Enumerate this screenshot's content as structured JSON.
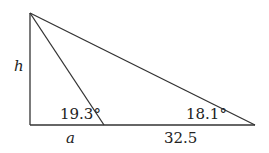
{
  "diagram": {
    "type": "right-triangle-with-cevian",
    "labels": {
      "height": "h",
      "base_left": "a",
      "base_right": "32.5",
      "angle_inner": "19.3°",
      "angle_right": "18.1°"
    },
    "points": {
      "top": [
        30,
        13
      ],
      "bottom_left": [
        30,
        125
      ],
      "foot": [
        104,
        125
      ],
      "right": [
        255,
        125
      ]
    }
  }
}
